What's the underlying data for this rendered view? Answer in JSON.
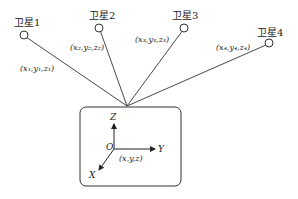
{
  "diagram": {
    "satellites": [
      {
        "name": "卫星1",
        "coord_label": "(x₁,y₁,z₁)"
      },
      {
        "name": "卫星2",
        "coord_label": "(x₂,y₂,z₂)"
      },
      {
        "name": "卫星3",
        "coord_label": "(x₃,y₃,z₃)"
      },
      {
        "name": "卫星4",
        "coord_label": "(x₄,y₄,z₄)"
      }
    ],
    "receiver": {
      "axes": {
        "z": "Z",
        "y": "Y",
        "x": "X",
        "origin": "O"
      },
      "coord_label": "(x,y,z)"
    }
  }
}
